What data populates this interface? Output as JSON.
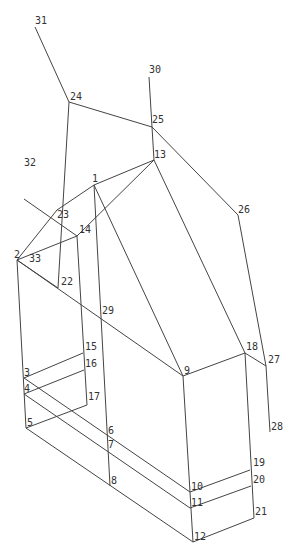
{
  "diagram": {
    "type": "wireframe-node-graph",
    "line_color": "#444444",
    "label_color": "#333333",
    "nodes": [
      {
        "id": "1",
        "x": 94,
        "y": 185,
        "lx": 92,
        "ly": 182
      },
      {
        "id": "2",
        "x": 17,
        "y": 260,
        "lx": 14,
        "ly": 258
      },
      {
        "id": "3",
        "x": 24,
        "y": 378,
        "lx": 24,
        "ly": 376
      },
      {
        "id": "4",
        "x": 24,
        "y": 394,
        "lx": 24,
        "ly": 392
      },
      {
        "id": "5",
        "x": 26,
        "y": 428,
        "lx": 27,
        "ly": 426
      },
      {
        "id": "6",
        "x": 108,
        "y": 440,
        "lx": 108,
        "ly": 434
      },
      {
        "id": "7",
        "x": 108,
        "y": 450,
        "lx": 108,
        "ly": 448
      },
      {
        "id": "8",
        "x": 110,
        "y": 486,
        "lx": 111,
        "ly": 484
      },
      {
        "id": "9",
        "x": 183,
        "y": 376,
        "lx": 184,
        "ly": 374
      },
      {
        "id": "10",
        "x": 190,
        "y": 492,
        "lx": 191,
        "ly": 490
      },
      {
        "id": "11",
        "x": 190,
        "y": 508,
        "lx": 191,
        "ly": 506
      },
      {
        "id": "12",
        "x": 193,
        "y": 542,
        "lx": 194,
        "ly": 540
      },
      {
        "id": "13",
        "x": 154,
        "y": 160,
        "lx": 154,
        "ly": 158
      },
      {
        "id": "14",
        "x": 77,
        "y": 236,
        "lx": 79,
        "ly": 233
      },
      {
        "id": "15",
        "x": 83,
        "y": 353,
        "lx": 85,
        "ly": 350
      },
      {
        "id": "16",
        "x": 84,
        "y": 370,
        "lx": 85,
        "ly": 367
      },
      {
        "id": "17",
        "x": 87,
        "y": 405,
        "lx": 88,
        "ly": 400
      },
      {
        "id": "18",
        "x": 245,
        "y": 353,
        "lx": 246,
        "ly": 350
      },
      {
        "id": "19",
        "x": 250,
        "y": 470,
        "lx": 253,
        "ly": 466
      },
      {
        "id": "20",
        "x": 251,
        "y": 486,
        "lx": 253,
        "ly": 483
      },
      {
        "id": "21",
        "x": 254,
        "y": 518,
        "lx": 255,
        "ly": 515
      },
      {
        "id": "22",
        "x": 58,
        "y": 288,
        "lx": 61,
        "ly": 285
      },
      {
        "id": "23",
        "x": 57,
        "y": 210,
        "lx": 57,
        "ly": 218
      },
      {
        "id": "24",
        "x": 69,
        "y": 102,
        "lx": 70,
        "ly": 100
      },
      {
        "id": "25",
        "x": 152,
        "y": 127,
        "lx": 152,
        "ly": 123
      },
      {
        "id": "26",
        "x": 238,
        "y": 215,
        "lx": 238,
        "ly": 213
      },
      {
        "id": "27",
        "x": 266,
        "y": 366,
        "lx": 268,
        "ly": 363
      },
      {
        "id": "28",
        "x": 270,
        "y": 432,
        "lx": 271,
        "ly": 430
      },
      {
        "id": "29",
        "x": 101,
        "y": 317,
        "lx": 102,
        "ly": 314
      },
      {
        "id": "30",
        "x": 149,
        "y": 77,
        "lx": 149,
        "ly": 73
      },
      {
        "id": "31",
        "x": 35,
        "y": 27,
        "lx": 35,
        "ly": 24
      },
      {
        "id": "32",
        "x": 24,
        "y": 199,
        "lx": 24,
        "ly": 166
      },
      {
        "id": "33",
        "x": 29,
        "y": 262,
        "lx": 29,
        "ly": 262
      }
    ],
    "edges": [
      [
        "31",
        "24"
      ],
      [
        "24",
        "25"
      ],
      [
        "30",
        "25"
      ],
      [
        "25",
        "13"
      ],
      [
        "25",
        "26"
      ],
      [
        "26",
        "27"
      ],
      [
        "18",
        "27"
      ],
      [
        "27",
        "28"
      ],
      [
        "24",
        "22"
      ],
      [
        "32",
        "14"
      ],
      [
        "2",
        "23"
      ],
      [
        "23",
        "1"
      ],
      [
        "1",
        "13"
      ],
      [
        "2",
        "14"
      ],
      [
        "14",
        "13"
      ],
      [
        "1",
        "9"
      ],
      [
        "13",
        "18"
      ],
      [
        "2",
        "9"
      ],
      [
        "2",
        "22"
      ],
      [
        "1",
        "8"
      ],
      [
        "14",
        "17"
      ],
      [
        "9",
        "18"
      ],
      [
        "9",
        "10"
      ],
      [
        "18",
        "21"
      ],
      [
        "2",
        "5"
      ],
      [
        "3",
        "15"
      ],
      [
        "4",
        "16"
      ],
      [
        "5",
        "17"
      ],
      [
        "3",
        "10"
      ],
      [
        "4",
        "11"
      ],
      [
        "5",
        "12"
      ],
      [
        "10",
        "19"
      ],
      [
        "11",
        "20"
      ],
      [
        "12",
        "21"
      ],
      [
        "10",
        "12"
      ]
    ]
  }
}
